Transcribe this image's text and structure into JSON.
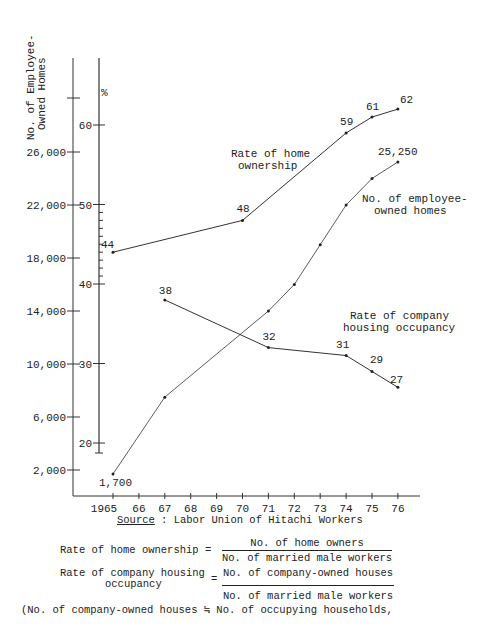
{
  "chart_data": {
    "type": "line",
    "title": "",
    "xlabel": "",
    "ylabel_left": "No. of Employee-Owned Homes",
    "ylabel_right": "%",
    "x_ticks": [
      "1965",
      "66",
      "67",
      "68",
      "69",
      "70",
      "71",
      "72",
      "73",
      "74",
      "75",
      "76"
    ],
    "left_axis_ticks": [
      "26,000",
      "22,000",
      "18,000",
      "14,000",
      "10,000",
      "6,000",
      "2,000"
    ],
    "right_axis_ticks": [
      "60",
      "50",
      "40",
      "30",
      "20"
    ],
    "series": [
      {
        "name": "Rate of home ownership",
        "axis": "right",
        "x": [
          1965,
          1970,
          1974,
          1975,
          1976
        ],
        "values": [
          44,
          48,
          59,
          61,
          62
        ],
        "labels": [
          "44",
          "48",
          "59",
          "61",
          "62"
        ]
      },
      {
        "name": "No. of employee-owned homes",
        "axis": "left",
        "x": [
          1965,
          1967,
          1971,
          1972,
          1973,
          1974,
          1975,
          1976
        ],
        "values": [
          1700,
          7500,
          14000,
          16000,
          19000,
          22000,
          24000,
          25250
        ],
        "labels": [
          "1,700",
          "",
          "",
          "",
          "",
          "",
          "",
          "25,250"
        ]
      },
      {
        "name": "Rate of company housing occupancy",
        "axis": "right",
        "x": [
          1967,
          1971,
          1974,
          1975,
          1976
        ],
        "values": [
          38,
          32,
          31,
          29,
          27
        ],
        "labels": [
          "38",
          "32",
          "31",
          "29",
          "27"
        ]
      }
    ],
    "annotations": [
      "Rate of home ownership",
      "No. of employee-owned homes",
      "Rate of company housing occupancy"
    ],
    "grid": false,
    "legend": "inline annotations"
  },
  "axis": {
    "left_label_line1": "No. of Employee-",
    "left_label_line2": "Owned Homes",
    "percent_sign": "%"
  },
  "labels": {
    "home_ownership_1": "Rate of home",
    "home_ownership_2": "ownership",
    "emp_homes_1": "No. of employee-",
    "emp_homes_2": "owned homes",
    "occupancy_1": "Rate of company",
    "occupancy_2": "housing occupancy"
  },
  "source": {
    "prefix": "Source",
    "text": " : Labor Union of Hitachi Workers"
  },
  "formulas": {
    "f1_label": "Rate of home ownership =",
    "f1_num": "No. of home owners",
    "f1_den": "No. of married male workers",
    "f2_label_1": "Rate of company housing",
    "f2_label_2": "occupancy",
    "f2_eq": "=",
    "f2_num": "No. of company-owned houses",
    "f2_den": "No. of married male workers",
    "f3": "(No. of company-owned houses ≒ No. of occupying households,"
  }
}
